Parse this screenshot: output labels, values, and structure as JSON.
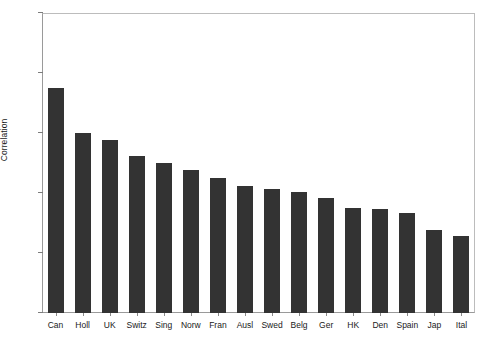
{
  "chart_data": {
    "type": "bar",
    "title": "",
    "xlabel": "",
    "ylabel": "Correlation",
    "ylim": [
      0,
      1
    ],
    "yticks": [
      "0",
      "0.2",
      "0.4",
      "0.6",
      "0.8",
      "1"
    ],
    "ytick_values": [
      0,
      0.2,
      0.4,
      0.6,
      0.8,
      1
    ],
    "grid": false,
    "legend": false,
    "bar_color": "#333333",
    "axis_color": "#9a9a9a",
    "categories": [
      "Can",
      "Holl",
      "UK",
      "Switz",
      "Sing",
      "Norw",
      "Fran",
      "Ausl",
      "Swed",
      "Belg",
      "Ger",
      "HK",
      "Den",
      "Spain",
      "Jap",
      "Ital"
    ],
    "values": [
      0.75,
      0.6,
      0.577,
      0.523,
      0.5,
      0.477,
      0.45,
      0.423,
      0.413,
      0.403,
      0.383,
      0.35,
      0.347,
      0.333,
      0.277,
      0.257
    ]
  }
}
